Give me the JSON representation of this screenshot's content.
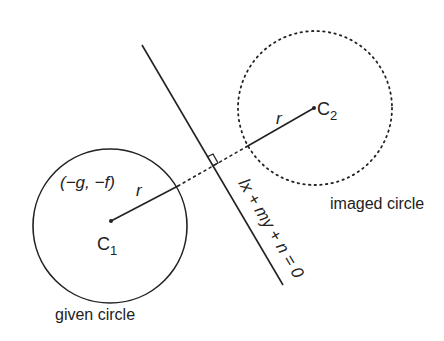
{
  "diagram": {
    "given_circle": {
      "label": "given circle",
      "center_label": "C",
      "center_sub": "1",
      "coords_label": "(−g, −f)",
      "radius_label": "r",
      "style": "solid"
    },
    "imaged_circle": {
      "label": "imaged circle",
      "center_label": "C",
      "center_sub": "2",
      "radius_label": "r",
      "style": "dotted"
    },
    "mirror_line": {
      "equation": "lx + my + n = 0"
    },
    "perpendicular_marker": "right-angle",
    "colors": {
      "stroke": "#222222",
      "background": "#ffffff"
    }
  }
}
